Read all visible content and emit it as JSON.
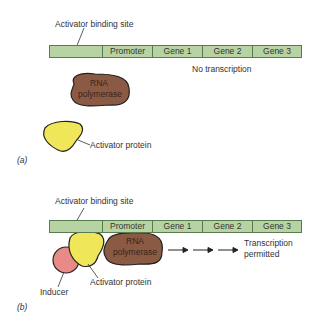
{
  "panel_a": {
    "label": "(a)",
    "binding_site_label": "Activator binding site",
    "dna_segments": [
      "",
      "Promoter",
      "Gene 1",
      "Gene 2",
      "Gene 3"
    ],
    "status": "No transcription",
    "polymerase_label_line1": "RNA",
    "polymerase_label_line2": "polymerase",
    "activator_label": "Activator protein"
  },
  "panel_b": {
    "label": "(b)",
    "binding_site_label": "Activator binding site",
    "dna_segments": [
      "",
      "Promoter",
      "Gene 1",
      "Gene 2",
      "Gene 3"
    ],
    "status_line1": "Transcription",
    "status_line2": "permitted",
    "polymerase_label_line1": "RNA",
    "polymerase_label_line2": "polymerase",
    "activator_label": "Activator protein",
    "inducer_label": "Inducer"
  },
  "colors": {
    "dna": "#b7d3a3",
    "polymerase": "#8b5a45",
    "activator": "#f0e65a",
    "inducer": "#e88a85"
  }
}
